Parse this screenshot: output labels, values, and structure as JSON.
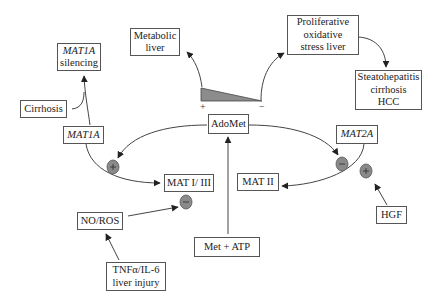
{
  "diagram": {
    "type": "pathway",
    "nodes": {
      "metabolic_liver": {
        "lines": [
          "Metabolic",
          "liver"
        ]
      },
      "mat1a_silencing": {
        "lines": [
          "MAT1A",
          "silencing"
        ],
        "italic_first_line": true
      },
      "cirrhosis": {
        "lines": [
          "Cirrhosis"
        ]
      },
      "mat1a": {
        "lines": [
          "MAT1A"
        ],
        "italic": true
      },
      "proliferative": {
        "lines": [
          "Proliferative",
          "oxidative",
          "stress liver"
        ]
      },
      "steatohepatitis": {
        "lines": [
          "Steatohepatitis",
          "cirrhosis",
          "HCC"
        ]
      },
      "adomet": {
        "lines": [
          "AdoMet"
        ]
      },
      "mat2a": {
        "lines": [
          "MAT2A"
        ],
        "italic": true
      },
      "mat1_3": {
        "lines": [
          "MAT I/ III"
        ]
      },
      "mat2": {
        "lines": [
          "MAT II"
        ]
      },
      "hgf": {
        "lines": [
          "HGF"
        ]
      },
      "no_ros": {
        "lines": [
          "NO/ROS"
        ]
      },
      "met_atp": {
        "lines": [
          "Met + ATP"
        ]
      },
      "tnf": {
        "lines": [
          "TNFα/IL-6",
          "liver injury"
        ]
      }
    },
    "gradient": {
      "plus_label": "+",
      "minus_label": "−",
      "fill": "#8c8c8c"
    },
    "regulators": [
      {
        "id": "mat1a_to_mat13",
        "sign": "+"
      },
      {
        "id": "no_ros_on_mat13",
        "sign": "−"
      },
      {
        "id": "adomet_on_mat2a",
        "sign": "−"
      },
      {
        "id": "hgf_on_mat2a",
        "sign": "+"
      }
    ],
    "edges": [
      {
        "from": "Met + ATP",
        "to": "AdoMet"
      },
      {
        "from": "AdoMet",
        "to": "MAT1A",
        "effect": "+"
      },
      {
        "from": "MAT1A",
        "to": "MAT I/ III"
      },
      {
        "from": "MAT1A",
        "to": "MAT1A silencing"
      },
      {
        "from": "Cirrhosis",
        "to": "MAT1A silencing"
      },
      {
        "from": "AdoMet",
        "to": "MAT2A",
        "effect": "−"
      },
      {
        "from": "MAT2A",
        "to": "MAT II"
      },
      {
        "from": "HGF",
        "to": "MAT2A",
        "effect": "+"
      },
      {
        "from": "NO/ROS",
        "to": "MAT I/ III",
        "effect": "−"
      },
      {
        "from": "TNFα/IL-6 liver injury",
        "to": "NO/ROS"
      },
      {
        "from": "AdoMet gradient (+)",
        "to": "Metabolic liver"
      },
      {
        "from": "AdoMet gradient (−)",
        "to": "Proliferative oxidative stress liver"
      },
      {
        "from": "Proliferative oxidative stress liver",
        "to": "Steatohepatitis cirrhosis HCC"
      }
    ],
    "colors": {
      "line": "#444444",
      "circle_fill": "#8a8a8a",
      "circle_stroke": "#555555",
      "border": "#555555"
    }
  }
}
